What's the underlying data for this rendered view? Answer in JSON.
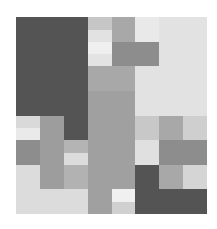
{
  "figure": {
    "title": "",
    "background_color": "#ffffff",
    "plot_area": {
      "x": 16,
      "y": 17,
      "width": 191,
      "height": 197
    }
  },
  "chart_data": {
    "type": "heatmap",
    "title": "",
    "xlabel": "",
    "ylabel": "",
    "grid": false,
    "legend": "none",
    "colormap": "grays",
    "axis_visible": false,
    "tick_labels_visible": false,
    "rows": 8,
    "cols": 8,
    "x": [
      0,
      1,
      2,
      3,
      4,
      5,
      6,
      7
    ],
    "y": [
      0,
      1,
      2,
      3,
      4,
      5,
      6,
      7
    ],
    "value_levels": [
      0,
      1,
      2,
      3,
      4
    ],
    "level_colors": [
      "#545454",
      "#8d8d8d",
      "#a8a8a8",
      "#c6c6c6",
      "#e2e2e2"
    ],
    "level_names": [
      "darkest",
      "dark",
      "medium",
      "light",
      "lightest"
    ],
    "values": [
      [
        0,
        0,
        0,
        3,
        2,
        4,
        4,
        4
      ],
      [
        0,
        0,
        0,
        4,
        1,
        1,
        4,
        4
      ],
      [
        0,
        0,
        0,
        2,
        2,
        4,
        4,
        4
      ],
      [
        0,
        0,
        0,
        2,
        2,
        4,
        4,
        4
      ],
      [
        3,
        1,
        0,
        2,
        2,
        3,
        2,
        3
      ],
      [
        1,
        1,
        3,
        2,
        2,
        4,
        1,
        1
      ],
      [
        3,
        1,
        1,
        2,
        2,
        0,
        2,
        3
      ],
      [
        3,
        3,
        3,
        2,
        3,
        0,
        0,
        0
      ]
    ],
    "cells": [
      {
        "row": 0,
        "col": 0,
        "value": 0,
        "color": "#545454"
      },
      {
        "row": 0,
        "col": 1,
        "value": 0,
        "color": "#545454"
      },
      {
        "row": 0,
        "col": 2,
        "value": 0,
        "color": "#545454"
      },
      {
        "row": 0,
        "col": 3,
        "value": 3,
        "color": "#c6c6c6"
      },
      {
        "row": 0,
        "col": 4,
        "value": 2,
        "color": "#a8a8a8"
      },
      {
        "row": 0,
        "col": 5,
        "value": 4,
        "color": "#e9e9e9"
      },
      {
        "row": 0,
        "col": 6,
        "value": 4,
        "color": "#e2e2e2"
      },
      {
        "row": 0,
        "col": 7,
        "value": 4,
        "color": "#e2e2e2"
      },
      {
        "row": 1,
        "col": 0,
        "value": 0,
        "color": "#545454"
      },
      {
        "row": 1,
        "col": 1,
        "value": 0,
        "color": "#545454"
      },
      {
        "row": 1,
        "col": 2,
        "value": 0,
        "color": "#545454"
      },
      {
        "row": 1,
        "col": 3,
        "value": 4,
        "color": "#e3e3e3"
      },
      {
        "row": 1,
        "col": 4,
        "value": 1,
        "color": "#8d8d8d"
      },
      {
        "row": 1,
        "col": 5,
        "value": 1,
        "color": "#8d8d8d"
      },
      {
        "row": 1,
        "col": 6,
        "value": 4,
        "color": "#e2e2e2"
      },
      {
        "row": 1,
        "col": 7,
        "value": 4,
        "color": "#e2e2e2"
      },
      {
        "row": 2,
        "col": 0,
        "value": 0,
        "color": "#545454"
      },
      {
        "row": 2,
        "col": 1,
        "value": 0,
        "color": "#545454"
      },
      {
        "row": 2,
        "col": 2,
        "value": 0,
        "color": "#545454"
      },
      {
        "row": 2,
        "col": 3,
        "value": 2,
        "color": "#a8a8a8"
      },
      {
        "row": 2,
        "col": 4,
        "value": 2,
        "color": "#a8a8a8"
      },
      {
        "row": 2,
        "col": 5,
        "value": 4,
        "color": "#e2e2e2"
      },
      {
        "row": 2,
        "col": 6,
        "value": 4,
        "color": "#e2e2e2"
      },
      {
        "row": 2,
        "col": 7,
        "value": 4,
        "color": "#e2e2e2"
      },
      {
        "row": 3,
        "col": 0,
        "value": 0,
        "color": "#545454"
      },
      {
        "row": 3,
        "col": 1,
        "value": 0,
        "color": "#545454"
      },
      {
        "row": 3,
        "col": 2,
        "value": 0,
        "color": "#545454"
      },
      {
        "row": 3,
        "col": 3,
        "value": 2,
        "color": "#a0a0a0"
      },
      {
        "row": 3,
        "col": 4,
        "value": 2,
        "color": "#a0a0a0"
      },
      {
        "row": 3,
        "col": 5,
        "value": 4,
        "color": "#e2e2e2"
      },
      {
        "row": 3,
        "col": 6,
        "value": 4,
        "color": "#e2e2e2"
      },
      {
        "row": 3,
        "col": 7,
        "value": 4,
        "color": "#e2e2e2"
      },
      {
        "row": 4,
        "col": 0,
        "value": 3,
        "color": "#d9d9d9"
      },
      {
        "row": 4,
        "col": 1,
        "value": 1,
        "color": "#9d9d9d"
      },
      {
        "row": 4,
        "col": 2,
        "value": 0,
        "color": "#545454"
      },
      {
        "row": 4,
        "col": 3,
        "value": 2,
        "color": "#a0a0a0"
      },
      {
        "row": 4,
        "col": 4,
        "value": 2,
        "color": "#a0a0a0"
      },
      {
        "row": 4,
        "col": 5,
        "value": 3,
        "color": "#c8c8c8"
      },
      {
        "row": 4,
        "col": 6,
        "value": 2,
        "color": "#a8a8a8"
      },
      {
        "row": 4,
        "col": 7,
        "value": 3,
        "color": "#cfcfcf"
      },
      {
        "row": 5,
        "col": 0,
        "value": 1,
        "color": "#8d8d8d"
      },
      {
        "row": 5,
        "col": 1,
        "value": 1,
        "color": "#9d9d9d"
      },
      {
        "row": 5,
        "col": 2,
        "value": 3,
        "color": "#dcdcdc"
      },
      {
        "row": 5,
        "col": 3,
        "value": 2,
        "color": "#a0a0a0"
      },
      {
        "row": 5,
        "col": 4,
        "value": 2,
        "color": "#a0a0a0"
      },
      {
        "row": 5,
        "col": 5,
        "value": 4,
        "color": "#e0e0e0"
      },
      {
        "row": 5,
        "col": 6,
        "value": 1,
        "color": "#8d8d8d"
      },
      {
        "row": 5,
        "col": 7,
        "value": 1,
        "color": "#8d8d8d"
      },
      {
        "row": 6,
        "col": 0,
        "value": 3,
        "color": "#dcdcdc"
      },
      {
        "row": 6,
        "col": 1,
        "value": 1,
        "color": "#9d9d9d"
      },
      {
        "row": 6,
        "col": 2,
        "value": 1,
        "color": "#b2b2b2"
      },
      {
        "row": 6,
        "col": 3,
        "value": 2,
        "color": "#a0a0a0"
      },
      {
        "row": 6,
        "col": 4,
        "value": 2,
        "color": "#a0a0a0"
      },
      {
        "row": 6,
        "col": 5,
        "value": 0,
        "color": "#545454"
      },
      {
        "row": 6,
        "col": 6,
        "value": 2,
        "color": "#a8a8a8"
      },
      {
        "row": 6,
        "col": 7,
        "value": 3,
        "color": "#d5d5d5"
      },
      {
        "row": 7,
        "col": 0,
        "value": 3,
        "color": "#dcdcdc"
      },
      {
        "row": 7,
        "col": 1,
        "value": 3,
        "color": "#dcdcdc"
      },
      {
        "row": 7,
        "col": 2,
        "value": 3,
        "color": "#dcdcdc"
      },
      {
        "row": 7,
        "col": 3,
        "value": 2,
        "color": "#a0a0a0"
      },
      {
        "row": 7,
        "col": 4,
        "value": 3,
        "color": "#d0d0d0"
      },
      {
        "row": 7,
        "col": 5,
        "value": 0,
        "color": "#545454"
      },
      {
        "row": 7,
        "col": 6,
        "value": 0,
        "color": "#545454"
      },
      {
        "row": 7,
        "col": 7,
        "value": 0,
        "color": "#545454"
      }
    ],
    "sub_cells": [
      {
        "row": 0,
        "col": 3,
        "half": "bottom",
        "color": "#e2e2e2"
      },
      {
        "row": 1,
        "col": 3,
        "half": "top",
        "color": "#efefef"
      },
      {
        "row": 4,
        "col": 0,
        "half": "bottom",
        "color": "#eaeaea"
      },
      {
        "row": 5,
        "col": 2,
        "half": "top",
        "color": "#b4b4b4"
      },
      {
        "row": 7,
        "col": 4,
        "half": "top",
        "color": "#f0f0f0"
      }
    ]
  }
}
